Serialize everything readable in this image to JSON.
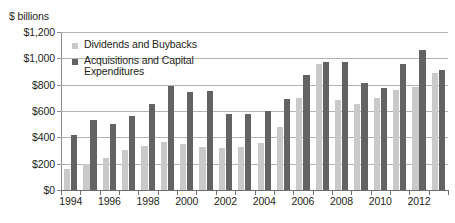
{
  "chart_data": {
    "type": "bar",
    "title": "",
    "subtitle": "",
    "xlabel": "",
    "ylabel": "$ billions",
    "ylim": [
      0,
      1200
    ],
    "ytick_labels": [
      "$1,200",
      "$1,000",
      "$800",
      "$600",
      "$400",
      "$200",
      "$0"
    ],
    "ytick_values": [
      1200,
      1000,
      800,
      600,
      400,
      200,
      0
    ],
    "grid": true,
    "legend_position": "upper-left-inside",
    "categories": [
      "1994",
      "1995",
      "1996",
      "1997",
      "1998",
      "1999",
      "2000",
      "2001",
      "2002",
      "2003",
      "2004",
      "2005",
      "2006",
      "2007",
      "2008",
      "2009",
      "2010",
      "2011",
      "2012",
      "2013"
    ],
    "xtick_labels": [
      "1994",
      "",
      "1996",
      "",
      "1998",
      "",
      "2000",
      "",
      "2002",
      "",
      "2004",
      "",
      "2006",
      "",
      "2008",
      "",
      "2010",
      "",
      "2012",
      ""
    ],
    "series": [
      {
        "name": "Dividends and Buybacks",
        "color": "#c9c9c9",
        "values": [
          160,
          195,
          240,
          305,
          335,
          365,
          350,
          325,
          320,
          330,
          355,
          480,
          700,
          960,
          680,
          650,
          700,
          760,
          780,
          890
        ]
      },
      {
        "name": "Acquisitions and Capital Expenditures",
        "color": "#636363",
        "values": [
          415,
          530,
          500,
          565,
          655,
          790,
          745,
          755,
          580,
          580,
          600,
          690,
          870,
          975,
          975,
          810,
          775,
          955,
          1065,
          915
        ]
      }
    ]
  }
}
